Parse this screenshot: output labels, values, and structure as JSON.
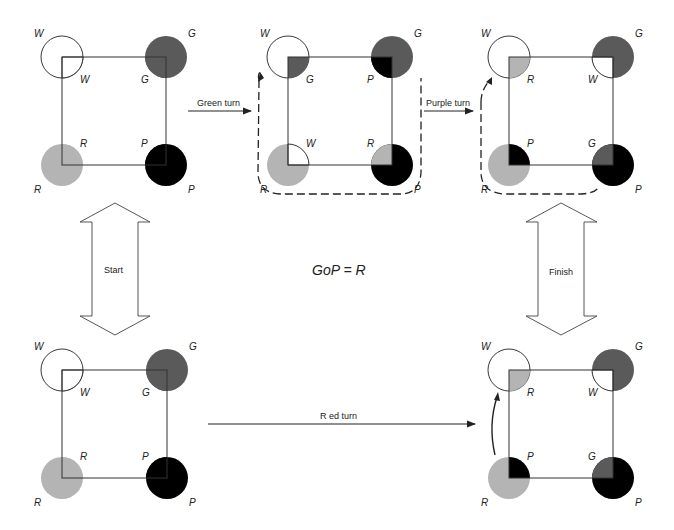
{
  "colors": {
    "W": "#ffffff",
    "G": "#5a5a5a",
    "R": "#b4b4b4",
    "P": "#000000",
    "line": "#222222"
  },
  "equation": "GoP = R",
  "transitions": {
    "green": "Green turn",
    "purple": "Purple turn",
    "red": "R ed turn",
    "start": "Start",
    "finish": "Finish"
  },
  "diagrams": [
    {
      "id": "start-top",
      "x": 62,
      "y": 57,
      "w": 104,
      "h": 108,
      "outer": {
        "tl": "W",
        "tr": "G",
        "bl": "R",
        "br": "P"
      },
      "inner": {
        "tl": "W",
        "tr": "G",
        "bl": "R",
        "br": "P"
      }
    },
    {
      "id": "after-green",
      "x": 288,
      "y": 57,
      "w": 104,
      "h": 108,
      "outer": {
        "tl": "W",
        "tr": "G",
        "bl": "R",
        "br": "P"
      },
      "inner": {
        "tl": "G",
        "tr": "P",
        "bl": "W",
        "br": "R"
      }
    },
    {
      "id": "after-purple",
      "x": 509,
      "y": 57,
      "w": 104,
      "h": 108,
      "outer": {
        "tl": "W",
        "tr": "G",
        "bl": "R",
        "br": "P"
      },
      "inner": {
        "tl": "R",
        "tr": "W",
        "bl": "P",
        "br": "G"
      }
    },
    {
      "id": "start-bottom",
      "x": 62,
      "y": 370,
      "w": 105,
      "h": 108,
      "outer": {
        "tl": "W",
        "tr": "G",
        "bl": "R",
        "br": "P"
      },
      "inner": {
        "tl": "W",
        "tr": "G",
        "bl": "R",
        "br": "P"
      }
    },
    {
      "id": "after-red",
      "x": 509,
      "y": 370,
      "w": 104,
      "h": 108,
      "outer": {
        "tl": "W",
        "tr": "G",
        "bl": "R",
        "br": "P"
      },
      "inner": {
        "tl": "R",
        "tr": "W",
        "bl": "P",
        "br": "G"
      }
    }
  ]
}
